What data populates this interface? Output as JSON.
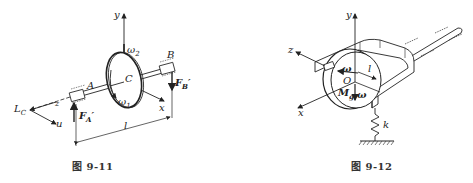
{
  "figures": [
    {
      "id": "fig-9-11",
      "caption": "图 9-11",
      "description": "Disk C on shaft between bearings A and B with reaction forces and precession angular velocities",
      "labels": {
        "y_axis": "y",
        "x_axis": "x",
        "z_axis": "z",
        "u_axis": "u",
        "point_A": "A",
        "point_B": "B",
        "point_C": "C",
        "point_LC": "L",
        "point_LC_sub": "C",
        "omega1": "ω",
        "omega1_sub": "1",
        "omega2": "ω",
        "omega2_sub": "2",
        "force_A": "F",
        "force_A_sub": "A",
        "force_A_prime": "′",
        "force_B": "F",
        "force_B_sub": "B",
        "force_B_prime": "′",
        "length": "l"
      }
    },
    {
      "id": "fig-9-12",
      "caption": "图 9-12",
      "description": "Rotating disk O in a U-shaped frame with shaft in bearings, supported by spring k",
      "labels": {
        "y_axis": "y",
        "x_axis": "x",
        "z_axis": "z",
        "omega_upper": "ω",
        "omega_lower": "ω",
        "point_O": "O",
        "moment": "M",
        "moment_sub": "g",
        "length": "l",
        "spring": "k"
      }
    }
  ]
}
